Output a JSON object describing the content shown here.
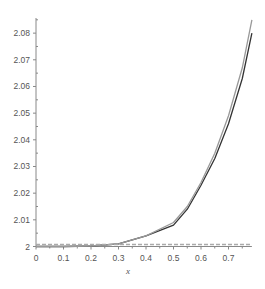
{
  "chart_data": {
    "type": "line",
    "title": "",
    "xlabel": "x",
    "ylabel": "",
    "xlim": [
      0,
      0.785
    ],
    "ylim": [
      2,
      2.086
    ],
    "grid": false,
    "legend": null,
    "x_ticks": [
      "0",
      "0.1",
      "0.2",
      "0.3",
      "0.4",
      "0.5",
      "0.6",
      "0.7"
    ],
    "y_ticks": [
      "2",
      "2.01",
      "2.02",
      "2.03",
      "2.04",
      "2.05",
      "2.06",
      "2.07",
      "2.08"
    ],
    "x": [
      0,
      0.1,
      0.2,
      0.3,
      0.4,
      0.5,
      0.55,
      0.6,
      0.65,
      0.7,
      0.75,
      0.785
    ],
    "series": [
      {
        "name": "curve-dark",
        "color": "#333333",
        "values": [
          2.0,
          2.0,
          2.0002,
          2.001,
          2.004,
          2.008,
          2.014,
          2.023,
          2.033,
          2.046,
          2.063,
          2.08
        ]
      },
      {
        "name": "curve-light",
        "color": "#999999",
        "values": [
          2.0,
          2.0,
          2.0002,
          2.001,
          2.004,
          2.009,
          2.015,
          2.024,
          2.035,
          2.049,
          2.067,
          2.085
        ]
      },
      {
        "name": "baseline-dashed",
        "color": "#aaaaaa",
        "style": "dashed",
        "values": [
          2.0,
          2.0,
          2.0,
          2.0,
          2.0,
          2.0,
          2.0,
          2.0,
          2.0,
          2.0,
          2.0,
          2.0
        ]
      }
    ]
  }
}
